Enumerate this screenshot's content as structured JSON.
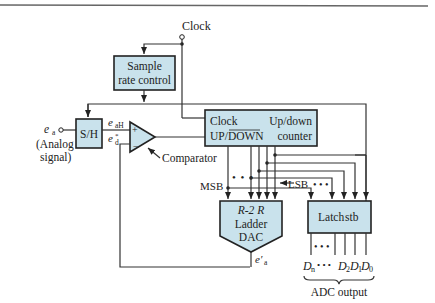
{
  "diagram": {
    "type": "block-diagram",
    "colors": {
      "block_fill": "#c9e2ec",
      "stroke": "#222222",
      "background": "#ffffff"
    },
    "labels": {
      "clock_input": "Clock",
      "analog_input": "e",
      "analog_input_sub": "a",
      "analog_caption_1": "(Analog",
      "analog_caption_2": "signal)",
      "sh_out": "e",
      "sh_out_sub": "aH",
      "dac_fb": "e",
      "dac_fb_sub": "d",
      "dac_fb_sup": "*",
      "comparator": "Comparator",
      "msb": "MSB",
      "lsb": "LSB",
      "dac_out": "e′",
      "dac_out_sub": "a",
      "adc_output": "ADC output",
      "plus": "+",
      "minus": "−",
      "dots": "• • •",
      "d_n": "D",
      "d_n_sub": "n",
      "d_2": "D",
      "d_2_sub": "2",
      "d_1": "D",
      "d_1_sub": "1",
      "d_0": "D",
      "d_0_sub": "0"
    },
    "blocks": {
      "sample_rate": {
        "line1": "Sample",
        "line2": "rate control"
      },
      "sh": {
        "label": "S/H"
      },
      "counter": {
        "clock": "Clock",
        "updown": "UP/DOWN",
        "title1": "Up/down",
        "title2": "counter"
      },
      "dac": {
        "line1": "R-2 R",
        "line2": "Ladder",
        "line3": "DAC"
      },
      "latch": {
        "label": "Latch",
        "strobe": "stb"
      }
    }
  }
}
